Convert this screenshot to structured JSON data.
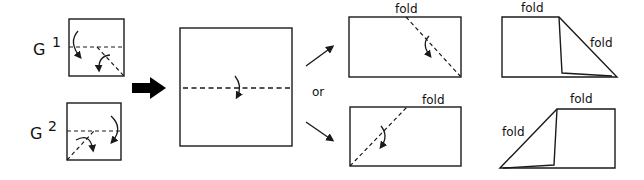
{
  "diagram": {
    "type": "origami folding steps",
    "labels": {
      "g1_letter": "G",
      "g1_index": "1",
      "g2_letter": "G",
      "g2_index": "2",
      "or": "or",
      "fold_top_rect": "fold",
      "fold_bottom_rect": "fold",
      "fold_right_top_1": "fold",
      "fold_right_top_2": "fold",
      "fold_right_bottom_1": "fold",
      "fold_right_bottom_2": "fold"
    },
    "colors": {
      "stroke": "#1a1a1a",
      "background": "#ffffff"
    }
  }
}
